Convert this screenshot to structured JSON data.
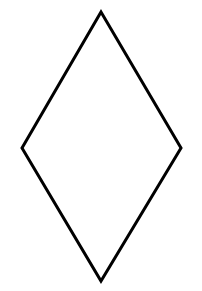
{
  "canvas": {
    "width": 202,
    "height": 291,
    "background_color": "#ffffff",
    "description": "Plain white drawing canvas containing a single geometric line drawing"
  },
  "figure": {
    "name": "rhombus",
    "label": "Rhombus",
    "shape_type": "rhombus",
    "alt_names": [
      "diamond",
      "kite",
      "lozenge"
    ],
    "fill_color": "#ffffff",
    "stroke_color": "#000000",
    "stroke_width": 3,
    "filled": false,
    "closed": true,
    "side_count": 4,
    "vertex_count": 4,
    "vertices": [
      {
        "name": "top-vertex",
        "x": 101,
        "y": 12
      },
      {
        "name": "right-vertex",
        "x": 181,
        "y": 148
      },
      {
        "name": "bottom-vertex",
        "x": 101,
        "y": 281
      },
      {
        "name": "left-vertex",
        "x": 22,
        "y": 148
      }
    ],
    "points_attr": "101,12 181,148 101,281 22,148",
    "diagonals": {
      "vertical_length": 269,
      "horizontal_length": 159
    },
    "center": {
      "x": 101,
      "y": 146
    }
  }
}
